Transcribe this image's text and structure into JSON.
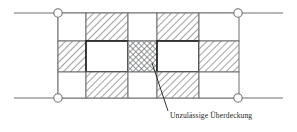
{
  "figure": {
    "title": "",
    "caption": "Unzulässige Überdeckung",
    "caption_icon": "leader-line"
  },
  "colors": {
    "line": "#6d6e71",
    "line_dark": "#231f20",
    "hatch": "#808285",
    "background": "#ffffff",
    "node_fill": "#ffffff",
    "text": "#231f20"
  },
  "geometry": {
    "grid_left": 58,
    "grid_right": 239,
    "grid_top": 13,
    "grid_bottom": 98,
    "row_tops": [
      13,
      41,
      72,
      98
    ],
    "col_edges": [
      58,
      86,
      128,
      157,
      199,
      239
    ],
    "axis_line_left": 14,
    "axis_line_right": 283,
    "node_radius": 4.2
  },
  "axis_lines": [
    {
      "name": "top-reference-line",
      "y": 13,
      "x1": 14,
      "x2": 283
    },
    {
      "name": "bottom-reference-line",
      "y": 98,
      "x1": 14,
      "x2": 283
    }
  ],
  "nodes": [
    {
      "name": "node-top-left",
      "x": 58,
      "y": 13
    },
    {
      "name": "node-top-right",
      "x": 238,
      "y": 13
    },
    {
      "name": "node-bottom-left",
      "x": 58,
      "y": 98
    },
    {
      "name": "node-bottom-right",
      "x": 238,
      "y": 98
    }
  ],
  "grid": {
    "columns": 5,
    "rows": 3,
    "cells": [
      {
        "row": 0,
        "col": 0,
        "fill": "plain",
        "name": "cell-top-1"
      },
      {
        "row": 0,
        "col": 1,
        "fill": "hatch",
        "name": "cell-top-2"
      },
      {
        "row": 0,
        "col": 2,
        "fill": "plain",
        "name": "cell-top-3"
      },
      {
        "row": 0,
        "col": 3,
        "fill": "hatch",
        "name": "cell-top-4"
      },
      {
        "row": 0,
        "col": 4,
        "fill": "plain",
        "name": "cell-top-5"
      },
      {
        "row": 1,
        "col": 0,
        "fill": "hatch",
        "name": "cell-mid-1"
      },
      {
        "row": 1,
        "col": 1,
        "fill": "plain-bold",
        "name": "cell-mid-2"
      },
      {
        "row": 1,
        "col": 2,
        "fill": "crosshatch",
        "name": "cell-mid-3-overlap"
      },
      {
        "row": 1,
        "col": 3,
        "fill": "plain-bold",
        "name": "cell-mid-4"
      },
      {
        "row": 1,
        "col": 4,
        "fill": "hatch",
        "name": "cell-mid-5"
      },
      {
        "row": 2,
        "col": 0,
        "fill": "plain",
        "name": "cell-bottom-1"
      },
      {
        "row": 2,
        "col": 1,
        "fill": "hatch",
        "name": "cell-bottom-2"
      },
      {
        "row": 2,
        "col": 2,
        "fill": "plain",
        "name": "cell-bottom-3"
      },
      {
        "row": 2,
        "col": 3,
        "fill": "hatch",
        "name": "cell-bottom-4"
      },
      {
        "row": 2,
        "col": 4,
        "fill": "plain",
        "name": "cell-bottom-5"
      }
    ]
  },
  "leader": {
    "name": "leader-line",
    "x1": 152,
    "y1": 63,
    "x2": 168,
    "y2": 110,
    "label_x": 170,
    "label_y": 117
  }
}
